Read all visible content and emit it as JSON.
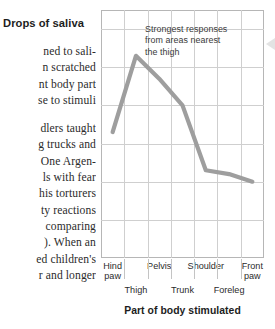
{
  "body_text": {
    "lines": [
      "ned to sali-",
      "n scratched",
      "nt body part",
      "se to stimuli",
      "",
      "dlers taught",
      "g trucks and",
      "One Argen-",
      "ls with fear",
      "his torturers",
      "ty reactions",
      "comparing",
      "). When an",
      "ed children's",
      "r and longer"
    ]
  },
  "chart_data": {
    "type": "line",
    "title": "",
    "xlabel": "Part of body stimulated",
    "ylabel": "Drops of saliva",
    "categories": [
      "Hind paw",
      "Thigh",
      "Pelvis",
      "Trunk",
      "Shoulder",
      "Foreleg",
      "Front paw"
    ],
    "values": [
      33,
      53,
      47,
      40,
      23,
      22,
      20
    ],
    "ylim": [
      0,
      65
    ],
    "yticks": [
      0,
      10,
      20,
      30,
      40,
      50,
      60
    ],
    "ytick_labels": [
      "0",
      "10",
      "20",
      "30",
      "40",
      "50",
      "60"
    ],
    "grid": true,
    "legend": "none",
    "line_color": "#9e9e9e",
    "annotations": [
      {
        "text": "Strongest responses from areas nearest the thigh",
        "lines": [
          "Strongest responses",
          "from areas nearest",
          "the thigh"
        ]
      }
    ]
  },
  "colors": {
    "line": "#9e9e9e",
    "grid": "#cfcfcf",
    "frame": "#b6b6b6",
    "text": "#2b2b2b"
  }
}
